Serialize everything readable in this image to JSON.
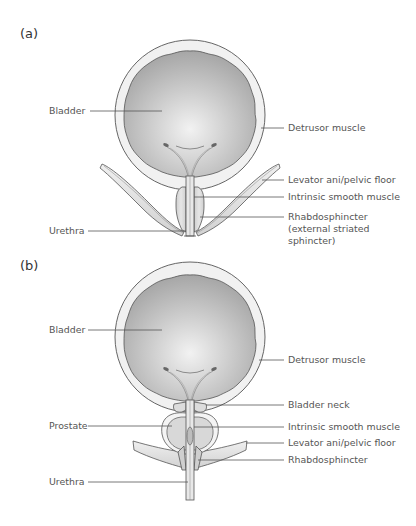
{
  "panels": [
    {
      "id": "a",
      "label": "(a)",
      "left_labels": {
        "bladder": "Bladder",
        "urethra": "Urethra"
      },
      "right_labels": {
        "detrusor": "Detrusor muscle",
        "levator": "Levator ani/pelvic floor",
        "intrinsic": "Intrinsic smooth muscle",
        "rhabdo": "Rhabdosphincter\n(external striated\nsphincter)"
      }
    },
    {
      "id": "b",
      "label": "(b)",
      "left_labels": {
        "bladder": "Bladder",
        "prostate": "Prostate",
        "urethra": "Urethra"
      },
      "right_labels": {
        "detrusor": "Detrusor muscle",
        "bladder_neck": "Bladder neck",
        "intrinsic": "Intrinsic smooth muscle",
        "levator": "Levator ani/pelvic floor",
        "rhabdo": "Rhabdosphincter"
      }
    }
  ],
  "colors": {
    "outline": "#555555",
    "wall": "#f1f1f1",
    "lumen_edge": "#a9a9a9",
    "lumen_center": "#efefef",
    "muscle": "#d6d6d6",
    "leader": "#555555"
  }
}
